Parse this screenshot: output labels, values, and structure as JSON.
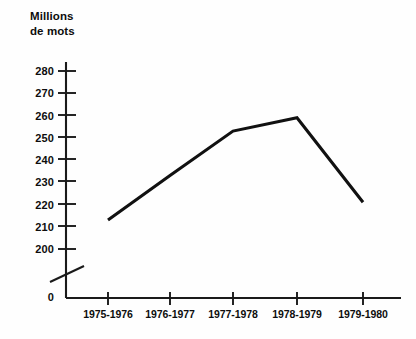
{
  "chart_data": {
    "type": "line",
    "title": "Millions\nde mots",
    "ylabel": "Millions de mots",
    "xlabel": "",
    "categories": [
      "1975-1976",
      "1976-1977",
      "1977-1978",
      "1978-1979",
      "1979-1980"
    ],
    "values": [
      213,
      233,
      253,
      259,
      221
    ],
    "series": [
      {
        "name": "Millions de mots",
        "values": [
          213,
          233,
          253,
          259,
          221
        ]
      }
    ],
    "ylim": [
      200,
      280
    ],
    "y_ticks": [
      200,
      210,
      220,
      230,
      240,
      250,
      260,
      270,
      280
    ],
    "y_tick_labels": [
      "200",
      "210",
      "220",
      "230",
      "240",
      "250",
      "260",
      "270",
      "280"
    ],
    "y_origin_label": "0",
    "axis_break": true,
    "axis_break_note": "diagonal slash on y-axis between 0 and 200",
    "grid": false,
    "legend": false,
    "legend_position": "none",
    "line_color": "#111111",
    "background_color": "#fefefe",
    "axis_color": "#222222"
  }
}
